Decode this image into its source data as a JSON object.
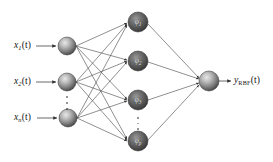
{
  "figure": {
    "name": "rbf-neural-network-architecture",
    "background_color": "#ffffff",
    "ink_color": "#3c3c3c",
    "node_fill_dark": "#4a4a4a",
    "node_fill_light": "#d8d8d8",
    "label_color": "#151515",
    "node_label_color": "#efefef"
  },
  "layers": {
    "input": {
      "name": "input-layer",
      "node_count_shown": 3,
      "has_ellipsis": true,
      "ellipsis_symbol": "⋮",
      "nodes": [
        {
          "id": "x1",
          "label_var": "x",
          "label_sub": "1",
          "label_arg": "(t)",
          "cx": 67,
          "cy": 46,
          "r": 9
        },
        {
          "id": "x2",
          "label_var": "x",
          "label_sub": "2",
          "label_arg": "(t)",
          "cx": 67,
          "cy": 82,
          "r": 9
        },
        {
          "id": "xn",
          "label_var": "x",
          "label_sub": "n",
          "label_arg": "(t)",
          "cx": 68,
          "cy": 118,
          "r": 9
        }
      ]
    },
    "hidden": {
      "name": "hidden-layer-rbf",
      "node_count_shown": 4,
      "has_ellipsis": true,
      "ellipsis_symbol": "⋮",
      "nodes": [
        {
          "id": "phi1",
          "label_var": "φ",
          "label_sub": "1",
          "cx": 138,
          "cy": 22,
          "r": 10
        },
        {
          "id": "phi2",
          "label_var": "φ",
          "label_sub": "2",
          "cx": 138,
          "cy": 61,
          "r": 10
        },
        {
          "id": "phi3",
          "label_var": "φ",
          "label_sub": "3",
          "cx": 138,
          "cy": 100,
          "r": 10
        },
        {
          "id": "phip",
          "label_var": "φ",
          "label_sub": "p",
          "cx": 138,
          "cy": 141,
          "r": 10
        }
      ]
    },
    "output": {
      "name": "output-layer",
      "node_count_shown": 1,
      "nodes": [
        {
          "id": "y",
          "cx": 209,
          "cy": 81,
          "r": 10
        }
      ]
    }
  },
  "input_labels": [
    {
      "name": "input-label-x1",
      "var": "x",
      "sub": "1",
      "arg": "(t)",
      "x": 14,
      "y": 41
    },
    {
      "name": "input-label-x2",
      "var": "x",
      "sub": "2",
      "arg": "(t)",
      "x": 14,
      "y": 77
    },
    {
      "name": "input-label-xn",
      "var": "x",
      "sub": "n",
      "arg": "(t)",
      "x": 14,
      "y": 113
    }
  ],
  "output_label": {
    "name": "output-label-yrbf",
    "var": "y",
    "sub": "RBF",
    "arg": "(t)",
    "x": 234,
    "y": 76,
    "text_plain": "y_RBF(t)"
  },
  "ellipses": [
    {
      "name": "input-layer-ellipsis",
      "x": 67,
      "y": 96,
      "height": 14
    },
    {
      "name": "hidden-layer-ellipsis",
      "x": 138,
      "y": 117,
      "height": 13
    }
  ],
  "edges": {
    "name": "network-connections",
    "input_to_hidden_count": 12,
    "hidden_to_output_count": 4,
    "arrowheads": true,
    "style": "solid-thin"
  },
  "arrows": {
    "input_entry": [
      {
        "name": "input-arrow-x1",
        "x1": 36,
        "y1": 46,
        "x2": 56,
        "y2": 46
      },
      {
        "name": "input-arrow-x2",
        "x1": 36,
        "y1": 82,
        "x2": 56,
        "y2": 82
      },
      {
        "name": "input-arrow-xn",
        "x1": 37,
        "y1": 118,
        "x2": 57,
        "y2": 118
      }
    ],
    "output_exit": {
      "name": "output-arrow",
      "x1": 219,
      "y1": 81,
      "x2": 231,
      "y2": 81
    }
  }
}
